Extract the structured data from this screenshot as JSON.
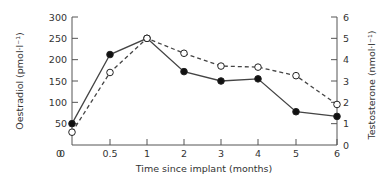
{
  "chart_data": {
    "type": "line",
    "title": "",
    "xlabel": "Time since implant (months)",
    "ylabel": "Oestradiol (pmol·l⁻¹)",
    "ylabel_right": "Testosterone (nmol·l⁻¹)",
    "x_tick_labels": [
      "0",
      "0.5",
      "1",
      "2",
      "3",
      "4",
      "5",
      "6"
    ],
    "y_left_ticks": [
      0,
      50,
      100,
      150,
      200,
      250,
      300
    ],
    "y_right_ticks": [
      0,
      1,
      2,
      3,
      4,
      5,
      6
    ],
    "ylim": [
      0,
      300
    ],
    "ylim_right": [
      0,
      6
    ],
    "grid": false,
    "legend": "none",
    "x": [
      "0",
      "0.5",
      "1",
      "2",
      "3",
      "4",
      "5",
      "6"
    ],
    "series": [
      {
        "name": "Oestradiol",
        "axis": "left",
        "marker": "filled-circle",
        "line": "solid",
        "values": [
          50,
          212,
          250,
          172,
          150,
          155,
          78,
          67
        ]
      },
      {
        "name": "Testosterone",
        "axis": "right",
        "marker": "open-circle",
        "line": "dashed",
        "values": [
          0.6,
          3.4,
          5.0,
          4.3,
          3.7,
          3.65,
          3.25,
          1.9
        ]
      }
    ]
  },
  "labels": {
    "xlabel": "Time since implant (months)",
    "ylabel_left": "Oestradiol (pmol·l⁻¹)",
    "ylabel_right": "Testosterone (nmol·l⁻¹)"
  },
  "colors": {
    "axis": "#555555",
    "line": "#444444",
    "text": "#333333"
  }
}
